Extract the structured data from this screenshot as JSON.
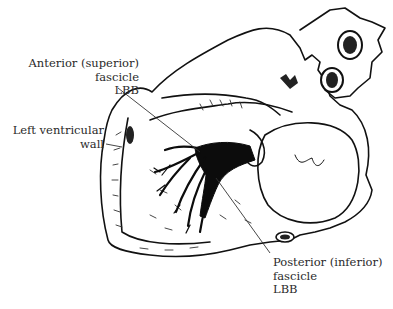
{
  "diagram": {
    "style": "black ink line illustration on white",
    "colors": {
      "background": "#ffffff",
      "ink": "#111111",
      "text": "#2a2a2a",
      "leader_line": "#333333"
    },
    "labels": [
      {
        "id": "anterior-fascicle",
        "lines": [
          "Anterior (superior)",
          "fascicle",
          "LBB"
        ],
        "align": "right"
      },
      {
        "id": "left-ventricular-wall",
        "lines": [
          "Left ventricular",
          "wall"
        ],
        "align": "right"
      },
      {
        "id": "posterior-fascicle",
        "lines": [
          "Posterior (inferior)",
          "fascicle",
          "LBB"
        ],
        "align": "left"
      }
    ]
  }
}
